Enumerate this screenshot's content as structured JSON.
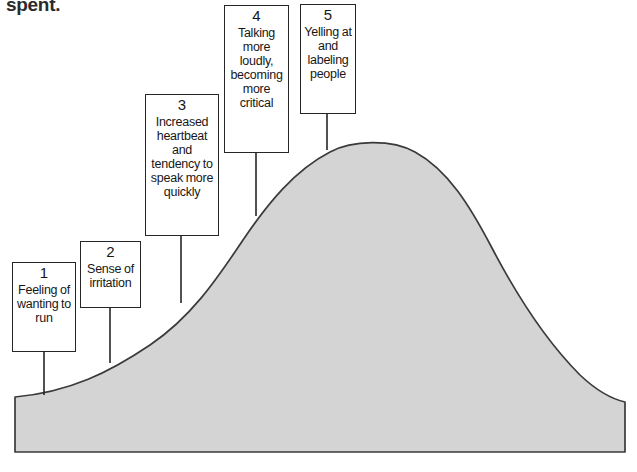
{
  "figure": {
    "cutoff_text": "spent.",
    "curve": {
      "fill_color": "#d4d4d4",
      "stroke_color": "#3a3a3a",
      "baseline_y": 452,
      "peak_x": 370,
      "peak_y": 142,
      "left_x": 15,
      "right_x": 625
    },
    "connector_color": "#262626"
  },
  "stages": [
    {
      "number": "1",
      "label": "Feeling of wanting to run",
      "connector_x": 44,
      "connector_top": 352,
      "connector_bottom": 395
    },
    {
      "number": "2",
      "label": "Sense of irritation",
      "connector_x": 110,
      "connector_top": 308,
      "connector_bottom": 363
    },
    {
      "number": "3",
      "label": "Increased heartbeat and tendency to speak more quickly",
      "connector_x": 181,
      "connector_top": 236,
      "connector_bottom": 303
    },
    {
      "number": "4",
      "label": "Talking more loudly, becoming more critical",
      "connector_x": 256,
      "connector_top": 153,
      "connector_bottom": 216
    },
    {
      "number": "5",
      "label": "Yelling at and labeling people",
      "connector_x": 327,
      "connector_top": 114,
      "connector_bottom": 150
    }
  ],
  "chart_data": {
    "type": "area",
    "xlabel": "",
    "ylabel": "",
    "x": [
      15,
      60,
      110,
      150,
      181,
      220,
      256,
      300,
      327,
      370,
      420,
      470,
      520,
      570,
      625
    ],
    "values": [
      55,
      62,
      90,
      120,
      150,
      205,
      237,
      285,
      304,
      310,
      296,
      250,
      185,
      120,
      52
    ],
    "annotations": [
      "1 Feeling of wanting to run",
      "2 Sense of irritation",
      "3 Increased heartbeat and tendency to speak more quickly",
      "4 Talking more loudly, becoming more critical",
      "5 Yelling at and labeling people"
    ],
    "grid": false,
    "legend": "none"
  }
}
